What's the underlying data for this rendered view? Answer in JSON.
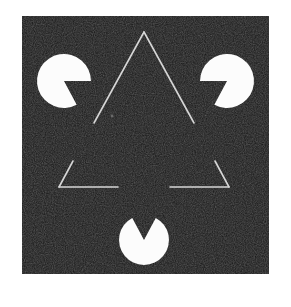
{
  "figure": {
    "canvas": {
      "width": 291,
      "height": 307
    },
    "background_color": "#ffffff",
    "panel": {
      "name": "noisy-dark-square",
      "x": 22,
      "y": 16,
      "width": 247,
      "height": 258,
      "fill_color": "#181818",
      "noise_color": "#3a3a3a",
      "noise_dark_color": "#000000"
    },
    "inducers": {
      "label": "pacman-discs",
      "fill_color": "#fcfcfc",
      "count": 3,
      "items": [
        {
          "name": "pacman-top-left",
          "cx": 64,
          "cy": 81,
          "r": 27,
          "notch_start_deg": 0,
          "notch_end_deg": 62,
          "notch_label": "wedge opens toward lower-right"
        },
        {
          "name": "pacman-top-right",
          "cx": 227,
          "cy": 81,
          "r": 27,
          "notch_start_deg": 118,
          "notch_end_deg": 180,
          "notch_label": "wedge opens toward lower-left"
        },
        {
          "name": "pacman-bottom-center",
          "cx": 144,
          "cy": 240,
          "r": 25,
          "notch_start_deg": 242,
          "notch_end_deg": 298,
          "notch_label": "wedge opens upward"
        }
      ]
    },
    "outline_triangle": {
      "name": "outlined-upward-triangle",
      "stroke_color": "#d6d6d6",
      "stroke_width": 1.6,
      "apex": {
        "x": 144,
        "y": 32
      },
      "bottom_left": {
        "x": 59,
        "y": 187
      },
      "bottom_right": {
        "x": 229,
        "y": 187
      },
      "segments": [
        {
          "name": "left-leg-upper",
          "x1": 144,
          "y1": 32,
          "x2": 94,
          "y2": 123
        },
        {
          "name": "left-leg-lower",
          "x1": 73,
          "y1": 161,
          "x2": 59,
          "y2": 187
        },
        {
          "name": "right-leg-upper",
          "x1": 144,
          "y1": 32,
          "x2": 194,
          "y2": 123
        },
        {
          "name": "right-leg-lower",
          "x1": 215,
          "y1": 161,
          "x2": 229,
          "y2": 187
        },
        {
          "name": "bottom-edge-left",
          "x1": 59,
          "y1": 187,
          "x2": 118,
          "y2": 187
        },
        {
          "name": "bottom-edge-right",
          "x1": 170,
          "y1": 187,
          "x2": 229,
          "y2": 187
        }
      ]
    },
    "illusory_triangle": {
      "name": "illusory-downward-triangle",
      "visible": false,
      "vertices": [
        {
          "x": 64,
          "y": 81
        },
        {
          "x": 227,
          "y": 81
        },
        {
          "x": 144,
          "y": 240
        }
      ]
    },
    "center_speck": {
      "name": "center-speck",
      "cx": 112,
      "cy": 116,
      "r": 1.4,
      "fill_color": "#6a6a6a"
    }
  }
}
